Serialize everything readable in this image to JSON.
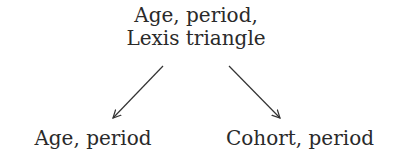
{
  "diagram": {
    "nodes": {
      "top": {
        "line1": "Age, period,",
        "line2": "Lexis triangle"
      },
      "left": {
        "label": "Age, period"
      },
      "right": {
        "label": "Cohort, period"
      }
    },
    "edges": [
      {
        "from": "top",
        "to": "left"
      },
      {
        "from": "top",
        "to": "right"
      }
    ],
    "colors": {
      "text": "#2a2a2a",
      "arrow": "#333333",
      "background": "#ffffff"
    }
  }
}
